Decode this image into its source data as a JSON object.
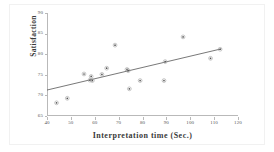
{
  "chart_data": {
    "type": "scatter",
    "title": "",
    "xlabel": "Interpretation time (Sec.)",
    "ylabel": "Satisfaction",
    "xlim": [
      40,
      120
    ],
    "ylim": [
      65,
      90
    ],
    "xticks": [
      40,
      50,
      60,
      70,
      80,
      90,
      100,
      110,
      120
    ],
    "yticks": [
      65,
      70,
      75,
      80,
      85,
      90
    ],
    "grid": false,
    "legend": null,
    "marker": "dot",
    "marker_color": "#555555",
    "line_color": "#555555",
    "points": [
      {
        "x": 44.0,
        "y": 68.2
      },
      {
        "x": 48.5,
        "y": 69.3
      },
      {
        "x": 55.5,
        "y": 75.2
      },
      {
        "x": 58.5,
        "y": 74.6
      },
      {
        "x": 58.0,
        "y": 73.7
      },
      {
        "x": 59.0,
        "y": 73.6
      },
      {
        "x": 63.0,
        "y": 75.1
      },
      {
        "x": 65.0,
        "y": 76.6
      },
      {
        "x": 68.5,
        "y": 82.2
      },
      {
        "x": 73.5,
        "y": 76.3
      },
      {
        "x": 74.0,
        "y": 76.0
      },
      {
        "x": 74.5,
        "y": 71.6
      },
      {
        "x": 79.0,
        "y": 73.6
      },
      {
        "x": 89.0,
        "y": 73.6
      },
      {
        "x": 89.5,
        "y": 78.2
      },
      {
        "x": 97.0,
        "y": 84.2
      },
      {
        "x": 108.5,
        "y": 79.0
      },
      {
        "x": 112.5,
        "y": 81.2
      }
    ],
    "trendline": {
      "x_start": 40.0,
      "y_start": 71.3,
      "x_end": 113.0,
      "y_end": 81.3
    }
  }
}
